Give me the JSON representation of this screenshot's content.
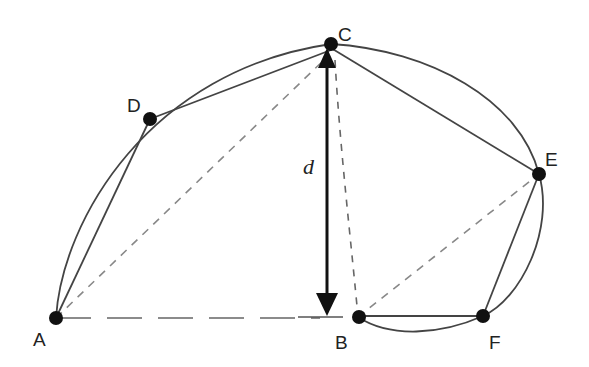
{
  "diagram": {
    "title": "",
    "points": [
      {
        "id": "A",
        "label": "A",
        "x": 56,
        "y": 318
      },
      {
        "id": "B",
        "label": "B",
        "x": 358,
        "y": 317
      },
      {
        "id": "C",
        "label": "C",
        "x": 331,
        "y": 44
      },
      {
        "id": "D",
        "label": "D",
        "x": 150,
        "y": 119
      },
      {
        "id": "E",
        "label": "E",
        "x": 539,
        "y": 174
      },
      {
        "id": "F",
        "label": "F",
        "x": 483,
        "y": 316
      }
    ],
    "labels": {
      "A": "A",
      "B": "B",
      "C": "C",
      "D": "D",
      "E": "E",
      "F": "F",
      "d": "d"
    },
    "solid_segments": [
      [
        "A",
        "D"
      ],
      [
        "D",
        "C"
      ],
      [
        "C",
        "E"
      ],
      [
        "E",
        "F"
      ],
      [
        "B",
        "F"
      ]
    ],
    "dashed_segments": [
      [
        "A",
        "C"
      ],
      [
        "C",
        "B"
      ],
      [
        "B",
        "E"
      ]
    ],
    "long_dashed_segments": [
      [
        "A",
        "B"
      ]
    ],
    "arcs": [
      {
        "from": "A",
        "to": "C",
        "through": "D"
      },
      {
        "from": "C",
        "to": "E"
      },
      {
        "from": "E",
        "to": "F"
      },
      {
        "from": "F",
        "to": "B"
      }
    ],
    "dimension": {
      "label": "d",
      "from": "C",
      "to": "baseline AB",
      "style": "double-headed vertical arrow"
    },
    "colors": {
      "stroke": "#333333",
      "dashed": "#777777",
      "point": "#111111",
      "background": "#ffffff"
    }
  }
}
